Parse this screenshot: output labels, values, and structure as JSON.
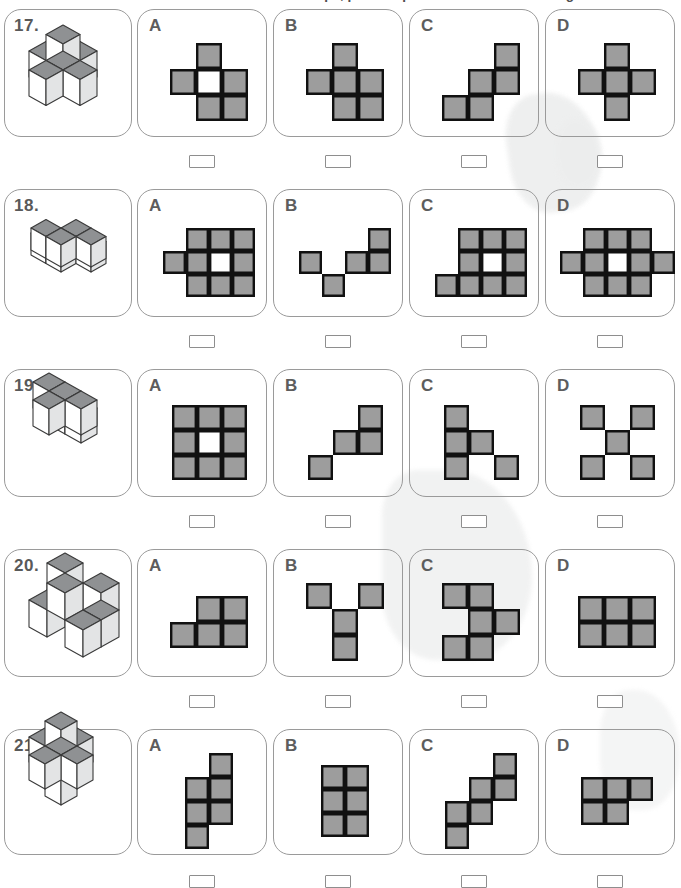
{
  "header": {
    "instruction_clipped": "each shape, pick the piece that folds into the figure on the left."
  },
  "palette": {
    "cell_fill": "#9d9d9d",
    "cell_stroke": "#111111",
    "cell_empty": "#ffffff",
    "card_border": "#9a9a9a",
    "label_color": "#5d5d5d",
    "cube_top": "#8f9193",
    "cube_left": "#ffffff",
    "cube_right": "#e3e4e5",
    "cube_stroke": "#3a3a3a"
  },
  "answer_box": {
    "value": "",
    "placeholder": ""
  },
  "option_letters": [
    "A",
    "B",
    "C",
    "D"
  ],
  "questions": [
    {
      "number": "17.",
      "figure_name": "isometric-cube-figure-17",
      "cube_count": 6,
      "options": [
        {
          "letter": "A",
          "rows": 3,
          "cols": 3,
          "cells": [
            [
              0,
              1,
              0
            ],
            [
              1,
              2,
              1
            ],
            [
              0,
              1,
              1
            ]
          ]
        },
        {
          "letter": "B",
          "rows": 3,
          "cols": 3,
          "cells": [
            [
              0,
              1,
              0
            ],
            [
              1,
              1,
              1
            ],
            [
              0,
              1,
              1
            ]
          ]
        },
        {
          "letter": "C",
          "rows": 3,
          "cols": 3,
          "cells": [
            [
              0,
              0,
              1
            ],
            [
              0,
              1,
              1
            ],
            [
              1,
              1,
              0
            ]
          ]
        },
        {
          "letter": "D",
          "rows": 3,
          "cols": 3,
          "cells": [
            [
              0,
              1,
              0
            ],
            [
              1,
              1,
              1
            ],
            [
              0,
              1,
              0
            ]
          ]
        }
      ]
    },
    {
      "number": "18.",
      "figure_name": "isometric-cube-figure-18",
      "cube_count": 8,
      "options": [
        {
          "letter": "A",
          "rows": 3,
          "cols": 4,
          "cells": [
            [
              0,
              1,
              1,
              1
            ],
            [
              1,
              1,
              2,
              1
            ],
            [
              0,
              1,
              1,
              1
            ]
          ]
        },
        {
          "letter": "B",
          "rows": 3,
          "cols": 4,
          "cells": [
            [
              0,
              0,
              0,
              1
            ],
            [
              1,
              0,
              1,
              1
            ],
            [
              0,
              1,
              0,
              0
            ]
          ]
        },
        {
          "letter": "C",
          "rows": 3,
          "cols": 4,
          "cells": [
            [
              0,
              1,
              1,
              1
            ],
            [
              0,
              1,
              2,
              1
            ],
            [
              1,
              1,
              1,
              1
            ]
          ]
        },
        {
          "letter": "D",
          "rows": 3,
          "cols": 5,
          "cells": [
            [
              0,
              1,
              1,
              1,
              0
            ],
            [
              1,
              1,
              2,
              1,
              1
            ],
            [
              0,
              1,
              1,
              1,
              0
            ]
          ]
        }
      ]
    },
    {
      "number": "19.",
      "figure_name": "isometric-cube-figure-19",
      "cube_count": 6,
      "options": [
        {
          "letter": "A",
          "rows": 3,
          "cols": 3,
          "cells": [
            [
              1,
              1,
              1
            ],
            [
              1,
              2,
              1
            ],
            [
              1,
              1,
              1
            ]
          ]
        },
        {
          "letter": "B",
          "rows": 3,
          "cols": 3,
          "cells": [
            [
              0,
              0,
              1
            ],
            [
              0,
              1,
              1
            ],
            [
              1,
              0,
              0
            ]
          ]
        },
        {
          "letter": "C",
          "rows": 3,
          "cols": 3,
          "cells": [
            [
              1,
              0,
              0
            ],
            [
              1,
              1,
              0
            ],
            [
              1,
              0,
              1
            ]
          ]
        },
        {
          "letter": "D",
          "rows": 3,
          "cols": 3,
          "cells": [
            [
              1,
              0,
              1
            ],
            [
              0,
              1,
              0
            ],
            [
              1,
              0,
              1
            ]
          ]
        }
      ]
    },
    {
      "number": "20.",
      "figure_name": "isometric-cube-figure-20",
      "cube_count": 7,
      "options": [
        {
          "letter": "A",
          "rows": 2,
          "cols": 3,
          "cells": [
            [
              0,
              1,
              1
            ],
            [
              1,
              1,
              1
            ]
          ]
        },
        {
          "letter": "B",
          "rows": 3,
          "cols": 3,
          "cells": [
            [
              1,
              0,
              1
            ],
            [
              0,
              1,
              0
            ],
            [
              0,
              1,
              0
            ]
          ]
        },
        {
          "letter": "C",
          "rows": 3,
          "cols": 3,
          "cells": [
            [
              1,
              1,
              0
            ],
            [
              0,
              1,
              1
            ],
            [
              1,
              1,
              0
            ]
          ]
        },
        {
          "letter": "D",
          "rows": 2,
          "cols": 3,
          "cells": [
            [
              1,
              1,
              1
            ],
            [
              1,
              1,
              1
            ]
          ]
        }
      ]
    },
    {
      "number": "21.",
      "figure_name": "isometric-cube-figure-21",
      "cube_count": 7,
      "options": [
        {
          "letter": "A",
          "rows": 4,
          "cols": 2,
          "cells": [
            [
              0,
              1
            ],
            [
              1,
              1
            ],
            [
              1,
              1
            ],
            [
              1,
              0
            ]
          ]
        },
        {
          "letter": "B",
          "rows": 3,
          "cols": 2,
          "cells": [
            [
              1,
              1
            ],
            [
              1,
              1
            ],
            [
              1,
              1
            ]
          ]
        },
        {
          "letter": "C",
          "rows": 4,
          "cols": 3,
          "cells": [
            [
              0,
              0,
              1
            ],
            [
              0,
              1,
              1
            ],
            [
              1,
              1,
              0
            ],
            [
              1,
              0,
              0
            ]
          ]
        },
        {
          "letter": "D",
          "rows": 2,
          "cols": 3,
          "cells": [
            [
              1,
              1,
              1
            ],
            [
              1,
              1,
              0
            ]
          ]
        }
      ]
    }
  ],
  "cube_figures": {
    "17": [
      [
        0,
        0,
        0
      ],
      [
        1,
        0,
        0
      ],
      [
        0,
        1,
        0
      ],
      [
        1,
        1,
        0
      ],
      [
        2,
        1,
        0
      ],
      [
        1,
        1,
        1
      ],
      [
        1,
        2,
        0
      ]
    ],
    "18": [
      [
        0,
        1,
        0
      ],
      [
        1,
        1,
        0
      ],
      [
        1,
        0,
        0
      ],
      [
        2,
        0,
        0
      ],
      [
        2,
        1,
        1
      ],
      [
        3,
        1,
        1
      ],
      [
        1,
        2,
        1
      ],
      [
        2,
        2,
        1
      ]
    ],
    "19": [
      [
        0,
        0,
        0
      ],
      [
        1,
        0,
        0
      ],
      [
        0,
        1,
        1
      ],
      [
        1,
        1,
        1
      ],
      [
        2,
        1,
        1
      ],
      [
        1,
        2,
        1
      ]
    ],
    "20": [
      [
        0,
        0,
        0
      ],
      [
        1,
        0,
        0
      ],
      [
        2,
        0,
        0
      ],
      [
        0,
        1,
        0
      ],
      [
        2,
        1,
        0
      ],
      [
        0,
        0,
        1
      ],
      [
        2,
        0,
        1
      ],
      [
        1,
        1,
        1
      ]
    ],
    "21": [
      [
        1,
        1,
        0
      ],
      [
        0,
        1,
        1
      ],
      [
        1,
        0,
        1
      ],
      [
        1,
        1,
        1
      ],
      [
        2,
        1,
        1
      ],
      [
        1,
        2,
        1
      ],
      [
        1,
        1,
        2
      ]
    ]
  }
}
